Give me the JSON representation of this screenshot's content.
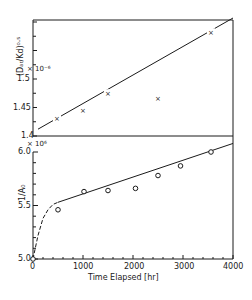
{
  "chart_data": [
    {
      "type": "scatter",
      "panel": "top",
      "title": "",
      "xlabel": "Time Elapsed [hr]",
      "ylabel": "(D_Ar/Kd)^0.5",
      "y_multiplier": "× 10^-6",
      "xlim": [
        0,
        4000
      ],
      "ylim": [
        1.4,
        1.6
      ],
      "yticks": [
        "1.4",
        "1.45",
        "1.5"
      ],
      "marker": "x",
      "x": [
        480,
        1000,
        1500,
        2500,
        3560
      ],
      "y": [
        1.43,
        1.444,
        1.475,
        1.465,
        1.582
      ],
      "fit_line": {
        "style": "solid",
        "x": [
          0,
          4000
        ],
        "y": [
          1.412,
          1.607
        ]
      },
      "grid": false
    },
    {
      "type": "scatter",
      "panel": "bottom",
      "title": "",
      "xlabel": "Time Elapsed [hr]",
      "ylabel": "1/A0",
      "y_multiplier": "× 10^6",
      "xlim": [
        0,
        4000
      ],
      "ylim": [
        5.0,
        6.0
      ],
      "xticks": [
        "0",
        "1000",
        "2000",
        "3000",
        "4000"
      ],
      "yticks": [
        "5.0",
        "5.5",
        "6.0"
      ],
      "marker": "o",
      "x": [
        0,
        500,
        1020,
        1500,
        2050,
        2500,
        2950,
        3560
      ],
      "y": [
        5.0,
        5.46,
        5.63,
        5.64,
        5.66,
        5.78,
        5.87,
        6.0
      ],
      "fit_line": {
        "style": "solid",
        "x": [
          500,
          4000
        ],
        "y": [
          5.53,
          6.08
        ]
      },
      "initial_curve": {
        "style": "dashed",
        "x": [
          0,
          100,
          200,
          300,
          400,
          500
        ],
        "y": [
          5.0,
          5.22,
          5.38,
          5.46,
          5.51,
          5.53
        ]
      },
      "grid": false
    }
  ],
  "labels": {
    "top_ylabel": "(Dₐᵣ/Kd)⁰·⁵",
    "top_multiplier": "× 10⁻⁶",
    "top_ticks": [
      "1.5",
      "1.45",
      "1.4"
    ],
    "bottom_ylabel": "1/A₀",
    "bottom_multiplier": "× 10⁶",
    "bottom_ticks": [
      "6.0",
      "5.5",
      "5.0"
    ],
    "xticks": [
      "0",
      "1000",
      "2000",
      "3000",
      "4000"
    ],
    "xlabel": "Time Elapsed [hr]"
  }
}
